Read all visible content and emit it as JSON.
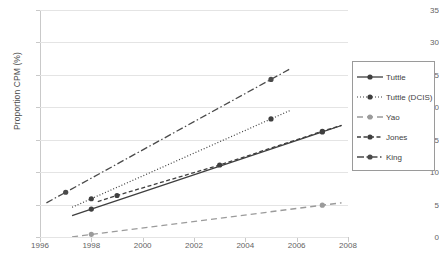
{
  "chart_data": {
    "type": "line",
    "title": "",
    "xlabel": "",
    "ylabel": "Proportion CPM (%)",
    "xlim": [
      1996,
      2008
    ],
    "ylim": [
      0,
      35
    ],
    "xticks": [
      1996,
      1998,
      2000,
      2002,
      2004,
      2006,
      2008
    ],
    "yticks": [
      0,
      5,
      10,
      15,
      20,
      25,
      30,
      35
    ],
    "grid": "horizontal",
    "legend_position": "right",
    "series": [
      {
        "name": "Tuttle",
        "style": "solid-with-markers",
        "color": "#3f3f3f",
        "x": [
          1998,
          2007
        ],
        "y": [
          4.3,
          16.2
        ]
      },
      {
        "name": "Tuttle (DCIS)",
        "style": "dotted-with-markers",
        "color": "#3f3f3f",
        "x": [
          1998,
          2005
        ],
        "y": [
          5.9,
          18.2
        ]
      },
      {
        "name": "Yao",
        "style": "long-dash-with-markers",
        "color": "#9b9b9b",
        "x": [
          1998,
          2007
        ],
        "y": [
          0.4,
          4.9
        ]
      },
      {
        "name": "Jones",
        "style": "short-dash-with-markers",
        "color": "#3f3f3f",
        "x": [
          1999,
          2003,
          2007
        ],
        "y": [
          6.4,
          11.1,
          16.3
        ]
      },
      {
        "name": "King",
        "style": "dash-dot-with-markers",
        "color": "#4a4a4a",
        "x": [
          1997,
          2005
        ],
        "y": [
          6.9,
          24.3
        ]
      }
    ]
  },
  "legend": {
    "items": [
      {
        "label": "Tuttle"
      },
      {
        "label": "Tuttle (DCIS)"
      },
      {
        "label": "Yao"
      },
      {
        "label": "Jones"
      },
      {
        "label": "King"
      }
    ]
  },
  "axis": {
    "y_title": "Proportion CPM (%)",
    "y_tick_labels": [
      "0",
      "5",
      "10",
      "15",
      "20",
      "25",
      "30",
      "35"
    ],
    "x_tick_labels": [
      "1996",
      "1998",
      "2000",
      "2002",
      "2004",
      "2006",
      "2008"
    ]
  }
}
